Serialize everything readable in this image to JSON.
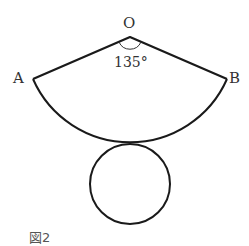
{
  "figure": {
    "caption": "図2",
    "labels": {
      "O": "O",
      "A": "A",
      "B": "B"
    },
    "angle_label": "135°",
    "line_color": "#1a1a1a"
  }
}
